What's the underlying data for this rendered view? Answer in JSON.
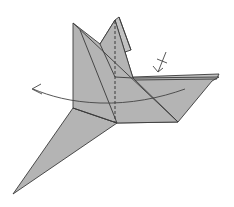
{
  "diagram": {
    "type": "origami-fold-step",
    "colors": {
      "paper": "#b4b4b4",
      "paper_light": "#c2c2c2",
      "line": "#3a3a3a",
      "background": "#ffffff"
    },
    "symbols": [
      {
        "name": "valley-fold-line",
        "style": "dashed",
        "orientation": "vertical"
      },
      {
        "name": "fold-over-arrow",
        "direction": "right-to-left",
        "style": "curved"
      },
      {
        "name": "pleat-hidden-fold-arrow",
        "style": "short arrow with crossed tail",
        "position": "upper-right"
      }
    ],
    "labels": []
  }
}
